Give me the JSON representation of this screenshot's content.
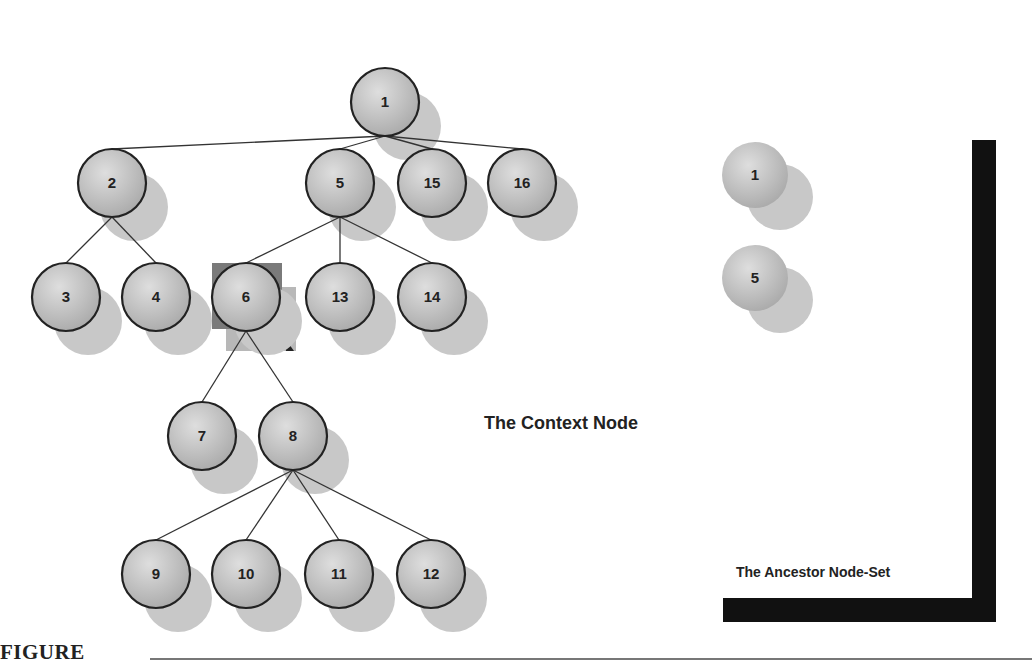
{
  "diagram": {
    "type": "tree",
    "context_label": "The Context Node",
    "ancestor_label": "The Ancestor Node-Set",
    "figure_label": "FIGURE",
    "context_node": "6",
    "ancestor_set": [
      "1",
      "5"
    ],
    "nodes": [
      {
        "id": "1",
        "x": 385,
        "y": 102
      },
      {
        "id": "2",
        "x": 112,
        "y": 183
      },
      {
        "id": "5",
        "x": 340,
        "y": 183
      },
      {
        "id": "15",
        "x": 432,
        "y": 183
      },
      {
        "id": "16",
        "x": 522,
        "y": 183
      },
      {
        "id": "3",
        "x": 66,
        "y": 297
      },
      {
        "id": "4",
        "x": 156,
        "y": 297
      },
      {
        "id": "6",
        "x": 246,
        "y": 297
      },
      {
        "id": "13",
        "x": 340,
        "y": 297
      },
      {
        "id": "14",
        "x": 432,
        "y": 297
      },
      {
        "id": "7",
        "x": 202,
        "y": 436
      },
      {
        "id": "8",
        "x": 293,
        "y": 436
      },
      {
        "id": "9",
        "x": 156,
        "y": 574
      },
      {
        "id": "10",
        "x": 246,
        "y": 574
      },
      {
        "id": "11",
        "x": 339,
        "y": 574
      },
      {
        "id": "12",
        "x": 431,
        "y": 574
      }
    ],
    "edges": [
      [
        "1",
        "2"
      ],
      [
        "1",
        "5"
      ],
      [
        "1",
        "15"
      ],
      [
        "1",
        "16"
      ],
      [
        "2",
        "3"
      ],
      [
        "2",
        "4"
      ],
      [
        "5",
        "6"
      ],
      [
        "5",
        "13"
      ],
      [
        "5",
        "14"
      ],
      [
        "6",
        "7"
      ],
      [
        "6",
        "8"
      ],
      [
        "8",
        "9"
      ],
      [
        "8",
        "10"
      ],
      [
        "8",
        "11"
      ],
      [
        "8",
        "12"
      ]
    ],
    "ancestor_panel_nodes": [
      {
        "id": "1",
        "x": 755,
        "y": 175
      },
      {
        "id": "5",
        "x": 755,
        "y": 278
      }
    ],
    "colors": {
      "node_fill": "#c4c4c4",
      "node_stroke": "#222222",
      "shadow": "#c8c8c8",
      "context_highlight_dark": "#7a7a7a",
      "context_highlight_light": "#b8b8b8",
      "bar": "#111111"
    }
  }
}
